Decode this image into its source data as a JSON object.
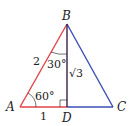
{
  "diagram": {
    "vertices": {
      "A": "A",
      "B": "B",
      "C": "C",
      "D": "D"
    },
    "side_labels": {
      "AB": "2",
      "AD": "1",
      "BD": "√3"
    },
    "angle_labels": {
      "A": "60°",
      "B": "30°"
    },
    "colors": {
      "red": "#e0454a",
      "blue": "#3c4fb5",
      "altitude": "#3a1f4a"
    }
  }
}
